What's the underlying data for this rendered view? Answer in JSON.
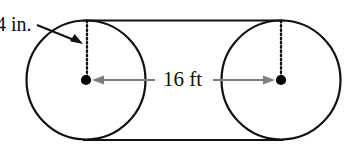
{
  "figure": {
    "shape_name": "two-circles-with-tangent-lines",
    "labels": {
      "radius_label": "4 in.",
      "distance_label": "16 ft"
    },
    "colors": {
      "outline": "#111111",
      "background": "#ffffff",
      "dimension_arrow": "#7a7a7a",
      "center_dot": "#000000",
      "dotted_radius": "#111111",
      "leader_arrow": "#111111"
    },
    "geometry": {
      "left_circle": {
        "cx": 86,
        "cy": 80,
        "r": 60
      },
      "right_circle": {
        "cx": 281,
        "cy": 80,
        "r": 60
      },
      "top_tangent_line": {
        "x1": 86,
        "y1": 20,
        "x2": 281,
        "y2": 20
      },
      "bottom_tangent_line": {
        "x1": 86,
        "y1": 140,
        "x2": 281,
        "y2": 140
      },
      "left_radius_dotted": {
        "x": 87,
        "y_top": 21,
        "y_bottom": 78
      },
      "right_radius_dotted": {
        "x": 281,
        "y_top": 21,
        "y_bottom": 78
      },
      "dimension_arrow_left": {
        "x1": 152,
        "y1": 80,
        "x2": 94,
        "y2": 80
      },
      "dimension_arrow_right": {
        "x1": 216,
        "y1": 80,
        "x2": 273,
        "y2": 80
      },
      "leader_arrow": {
        "x1": 36,
        "y1": 26,
        "x2": 82,
        "y2": 44
      }
    }
  }
}
